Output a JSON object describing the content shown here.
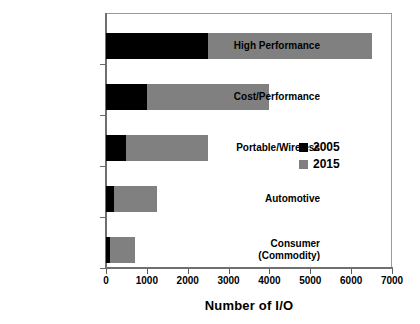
{
  "chart_data": {
    "type": "bar",
    "orientation": "horizontal",
    "stacked": true,
    "title": "",
    "xlabel": "Number of I/O",
    "ylabel": "",
    "xlim": [
      0,
      7000
    ],
    "xticks": [
      0,
      1000,
      2000,
      3000,
      4000,
      5000,
      6000,
      7000
    ],
    "xtick_labels": [
      "0",
      "1000",
      "2000",
      "3000",
      "4000",
      "5000",
      "6000",
      "7000"
    ],
    "grid": false,
    "legend_position": "center-right",
    "categories": [
      "High Performance",
      "Cost/Performance",
      "Portable/Wireless",
      "Automotive",
      "Consumer\n(Commodity)"
    ],
    "category_labels": [
      [
        "High Performance"
      ],
      [
        "Cost/Performance"
      ],
      [
        "Portable/Wireless"
      ],
      [
        "Automotive"
      ],
      [
        "Consumer",
        "(Commodity)"
      ]
    ],
    "series": [
      {
        "name": "2005",
        "color": "#000000",
        "values": [
          2500,
          1000,
          500,
          200,
          100
        ]
      },
      {
        "name": "2015",
        "color": "#808080",
        "values": [
          4000,
          3000,
          2000,
          1050,
          600
        ]
      }
    ],
    "totals": [
      6500,
      4000,
      2500,
      1250,
      700
    ],
    "legend": [
      {
        "label": "2005",
        "color": "#000000"
      },
      {
        "label": "2015",
        "color": "#808080"
      }
    ],
    "colors": {
      "series_2005": "#000000",
      "series_2015": "#808080",
      "axis": "#6f6f6f",
      "frame": "#8c8c8c",
      "background": "#ffffff",
      "text": "#000000"
    }
  }
}
